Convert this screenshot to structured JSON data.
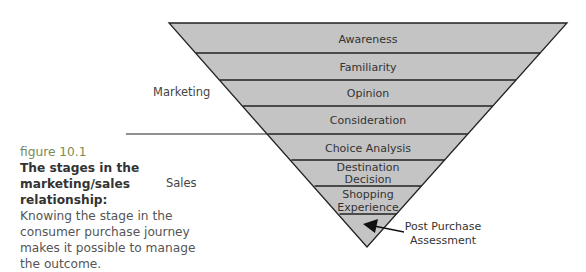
{
  "caption": {
    "label": "figure 10.1",
    "title": "The stages in the marketing/sales relationship:",
    "body": "Knowing the stage in the consumer purchase journey makes it possible to manage the outcome."
  },
  "side_labels": {
    "marketing": "Marketing",
    "sales": "Sales"
  },
  "funnel": {
    "fill_color": "#c4c4c4",
    "line_color": "#222222",
    "stages": [
      {
        "line1": "Awareness",
        "line2": ""
      },
      {
        "line1": "Familiarity",
        "line2": ""
      },
      {
        "line1": "Opinion",
        "line2": ""
      },
      {
        "line1": "Consideration",
        "line2": ""
      },
      {
        "line1": "Choice Analysis",
        "line2": ""
      },
      {
        "line1": "Destination",
        "line2": "Decision"
      },
      {
        "line1": "Shopping",
        "line2": "Experience"
      }
    ],
    "final_stage": {
      "line1": "Post Purchase",
      "line2": "Assessment"
    }
  }
}
